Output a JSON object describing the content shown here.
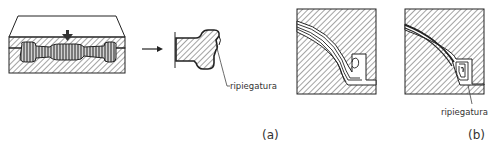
{
  "figure": {
    "panel_a": {
      "caption": "(a)",
      "annotation": "ripiegatura",
      "arrow": "right-arrow"
    },
    "panel_b": {
      "caption": "(b)",
      "annotation": "ripiegatura"
    }
  },
  "colors": {
    "line": "#222222",
    "hatch": "#555555",
    "fill_dark": "#6f6f6f",
    "background": "#ffffff"
  }
}
